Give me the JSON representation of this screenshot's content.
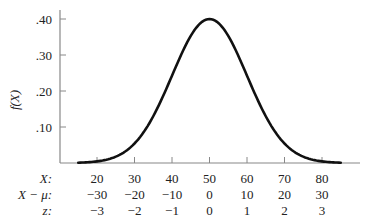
{
  "chart_data": {
    "type": "line",
    "title": "",
    "ylabel": "f(X)",
    "xlabel": "X",
    "distribution": "normal",
    "mu": 50,
    "sigma": 10,
    "peak_value": 0.4,
    "xlim": [
      15,
      85
    ],
    "ylim": [
      0,
      0.42
    ],
    "y_ticks": [
      ".10",
      ".20",
      ".30",
      ".40"
    ],
    "y_tick_values": [
      0.1,
      0.2,
      0.3,
      0.4
    ],
    "x_tick_values": [
      20,
      30,
      40,
      50,
      60,
      70,
      80
    ],
    "grid": false,
    "label_rows": [
      {
        "label": "X:",
        "values": [
          "20",
          "30",
          "40",
          "50",
          "60",
          "70",
          "80"
        ]
      },
      {
        "label": "X − μ:",
        "values": [
          "−30",
          "−20",
          "−10",
          "0",
          "10",
          "20",
          "30"
        ]
      },
      {
        "label": "z:",
        "values": [
          "−3",
          "−2",
          "−1",
          "0",
          "1",
          "2",
          "3"
        ]
      }
    ]
  },
  "colors": {
    "curve": "#111111",
    "axis": "#888888",
    "text": "#222222"
  }
}
